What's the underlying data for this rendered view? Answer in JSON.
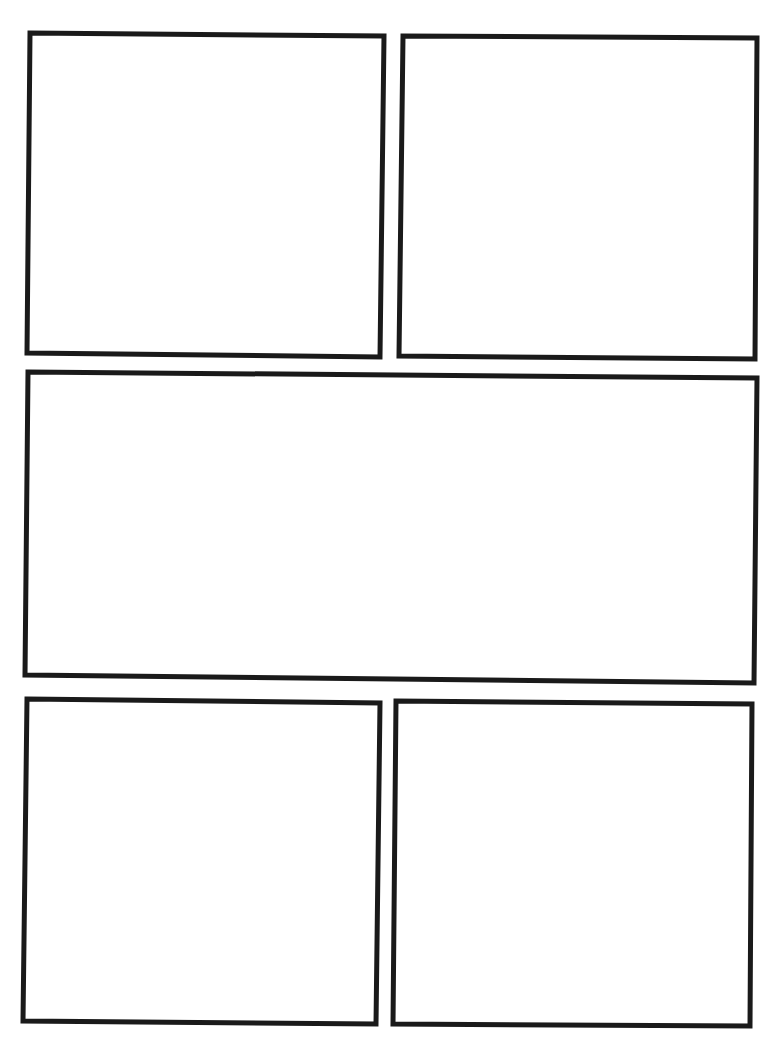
{
  "page": {
    "type": "comic-page-template",
    "background": "#ffffff",
    "border_color": "#1a1a1a",
    "panel_count": 5
  },
  "panels": [
    {
      "id": "panel-1",
      "row": 1,
      "points": "30,33 384,36 380,357 27,353"
    },
    {
      "id": "panel-2",
      "row": 1,
      "points": "403,36 757,38 755,359 399,356"
    },
    {
      "id": "panel-3",
      "row": 2,
      "points": "28,372 757,378 754,683 25,675"
    },
    {
      "id": "panel-4",
      "row": 3,
      "points": "27,699 380,703 376,1024 23,1021"
    },
    {
      "id": "panel-5",
      "row": 3,
      "points": "396,701 752,704 750,1026 393,1024"
    }
  ]
}
